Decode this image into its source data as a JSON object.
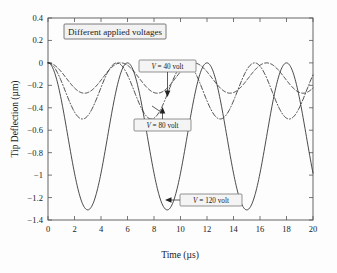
{
  "chart_data": {
    "type": "line",
    "title": "Different applied voltages",
    "xlabel": "Time (µs)",
    "ylabel": "Tip Deflection (µm)",
    "xlim": [
      0,
      20
    ],
    "ylim": [
      -1.4,
      0.4
    ],
    "grid": false,
    "legend_position": "inline-annotations",
    "x_ticks": [
      "0",
      "2",
      "4",
      "6",
      "8",
      "10",
      "12",
      "14",
      "16",
      "18",
      "20"
    ],
    "x_tick_values": [
      0,
      2,
      4,
      6,
      8,
      10,
      12,
      14,
      16,
      18,
      20
    ],
    "y_ticks": [
      "0.4",
      "0.2",
      "0",
      "−0.2",
      "−0.4",
      "−0.6",
      "−0.8",
      "−1",
      "−1.2",
      "−1.4"
    ],
    "y_tick_values": [
      0.4,
      0.2,
      0,
      -0.2,
      -0.4,
      -0.6,
      -0.8,
      -1.0,
      -1.2,
      -1.4
    ],
    "series": [
      {
        "name": "V = 40 volt",
        "style": "dashed",
        "amplitude": 0.135,
        "offset": -0.135,
        "period": 5.5,
        "minimum": -0.27,
        "maximum": 0.0,
        "x": [
          0,
          0.5,
          1,
          1.5,
          2,
          2.5,
          2.75,
          3,
          3.5,
          4,
          4.5,
          5,
          5.5,
          6,
          6.5,
          7,
          7.5,
          8,
          8.25,
          8.5,
          9,
          9.5,
          10,
          10.5,
          11,
          11.5,
          12,
          12.5,
          13,
          13.5,
          13.75,
          14,
          14.5,
          15,
          15.5,
          16,
          16.5,
          17,
          17.5,
          18,
          18.5,
          19,
          19.25,
          19.5,
          20
        ],
        "y": [
          0,
          -0.022,
          -0.084,
          -0.161,
          -0.228,
          -0.264,
          -0.27,
          -0.268,
          -0.239,
          -0.178,
          -0.104,
          -0.039,
          -0.004,
          -0.008,
          -0.049,
          -0.116,
          -0.191,
          -0.248,
          -0.264,
          -0.27,
          -0.256,
          -0.205,
          -0.133,
          -0.06,
          -0.012,
          -0.001,
          -0.03,
          -0.09,
          -0.166,
          -0.233,
          -0.255,
          -0.267,
          -0.269,
          -0.245,
          -0.187,
          -0.114,
          -0.047,
          -0.007,
          -0.005,
          -0.042,
          -0.107,
          -0.183,
          -0.215,
          -0.242,
          -0.266
        ]
      },
      {
        "name": "V = 80 volt",
        "style": "dash-dot",
        "amplitude": 0.25,
        "offset": -0.25,
        "period": 5.2,
        "minimum": -0.5,
        "maximum": 0.0,
        "x": [
          0,
          0.5,
          1,
          1.5,
          2,
          2.5,
          2.6,
          3,
          3.5,
          4,
          4.5,
          5,
          5.2,
          5.5,
          6,
          6.5,
          7,
          7.5,
          7.8,
          8,
          8.5,
          9,
          9.5,
          10,
          10.4,
          11,
          11.5,
          12,
          12.5,
          13,
          13.5,
          14,
          14.5,
          15,
          15.6,
          16,
          16.5,
          17,
          17.5,
          18,
          18.5,
          19,
          19.5,
          20
        ],
        "y": [
          0,
          -0.046,
          -0.171,
          -0.322,
          -0.437,
          -0.494,
          -0.5,
          -0.486,
          -0.405,
          -0.284,
          -0.152,
          -0.047,
          -0.008,
          -0.003,
          -0.062,
          -0.183,
          -0.332,
          -0.45,
          -0.494,
          -0.5,
          -0.473,
          -0.378,
          -0.24,
          -0.104,
          -0.014,
          -0.018,
          -0.102,
          -0.236,
          -0.375,
          -0.47,
          -0.5,
          -0.474,
          -0.382,
          -0.249,
          -0.049,
          -0.02,
          -0.093,
          -0.221,
          -0.363,
          -0.464,
          -0.5,
          -0.478,
          -0.392,
          -0.26
        ]
      },
      {
        "name": "V = 120 volt",
        "style": "solid",
        "amplitude": 0.655,
        "offset": -0.655,
        "period": 6.0,
        "minimum": -1.31,
        "maximum": 0.03,
        "x": [
          0,
          0.5,
          1,
          1.5,
          2,
          2.5,
          3,
          3.5,
          4,
          4.5,
          5,
          5.5,
          6,
          6.5,
          7,
          7.5,
          8,
          8.5,
          9,
          9.5,
          10,
          10.5,
          11,
          11.5,
          12,
          12.5,
          13,
          13.5,
          14,
          14.5,
          15,
          15.5,
          16,
          16.5,
          17,
          17.5,
          18,
          18.5,
          19,
          19.5,
          20
        ],
        "y": [
          0,
          -0.09,
          -0.345,
          -0.69,
          -1.02,
          -1.24,
          -1.31,
          -1.25,
          -1.03,
          -0.71,
          -0.36,
          -0.09,
          0.0,
          -0.09,
          -0.35,
          -0.7,
          -1.03,
          -1.25,
          -1.31,
          -1.24,
          -1.02,
          -0.69,
          -0.34,
          -0.08,
          0.01,
          -0.08,
          -0.34,
          -0.69,
          -1.02,
          -1.25,
          -1.31,
          -1.24,
          -1.02,
          -0.68,
          -0.33,
          -0.07,
          0.03,
          -0.08,
          -0.33,
          -0.68,
          -1.0
        ]
      }
    ],
    "annotations": [
      {
        "label": "V = 40 volt",
        "target_x": 8.3,
        "target_y": -0.27,
        "arrow": "down"
      },
      {
        "label": "V = 80 volt",
        "target_x": 8.0,
        "target_y": -0.48,
        "arrow": "up"
      },
      {
        "label": "V = 120 volt",
        "target_x": 9.2,
        "target_y": -1.27,
        "arrow": "left"
      }
    ]
  },
  "labels": {
    "title_box": "Different applied voltages",
    "y_axis_title": "Tip Deflection (µm)",
    "x_axis_title": "Time (µs)",
    "anno_40": "V = 40 volt",
    "anno_80": "V = 80 volt",
    "anno_120": "V = 120 volt",
    "anno_40_italic": "V",
    "anno_40_rest": " = 40 volt",
    "anno_80_italic": "V",
    "anno_80_rest": " = 80 volt",
    "anno_120_italic": "V",
    "anno_120_rest": " = 120 volt"
  },
  "ticks": {
    "x": [
      "0",
      "2",
      "4",
      "6",
      "8",
      "10",
      "12",
      "14",
      "16",
      "18",
      "20"
    ],
    "y": [
      "0.4",
      "0.2",
      "0",
      "−0.2",
      "−0.4",
      "−0.6",
      "−0.8",
      "−1",
      "−1.2",
      "−1.4"
    ]
  },
  "colors": {
    "curve": "#2a2a2a",
    "frame": "#555555",
    "background": "#fdfdfd",
    "box_fill": "#f2f2f2"
  }
}
